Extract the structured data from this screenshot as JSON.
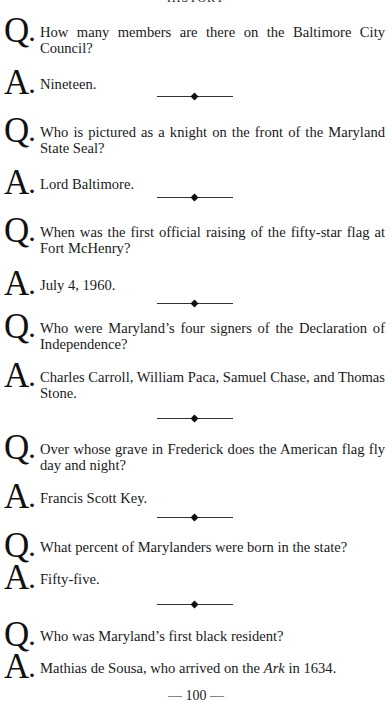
{
  "running_head": "HISTORY",
  "markers": {
    "question": "Q",
    "answer": "A",
    "dot": "."
  },
  "items": [
    {
      "question": "How many members are there on the Baltimore City Council?",
      "answer": "Nineteen."
    },
    {
      "question": "Who is pictured as a knight on the front of the Maryland State Seal?",
      "answer": "Lord Baltimore."
    },
    {
      "question": "When was the first official raising of the fifty-star flag at Fort McHenry?",
      "answer": "July 4, 1960."
    },
    {
      "question": "Who were Maryland’s four signers of the Declaration of Independence?",
      "answer": "Charles Carroll, William Paca, Samuel Chase, and Thomas Stone."
    },
    {
      "question": "Over whose grave in Frederick does the American flag fly day and night?",
      "answer": "Francis Scott Key."
    },
    {
      "question": "What percent of Marylanders were born in the state?",
      "answer": "Fifty-five."
    },
    {
      "question": "Who was Maryland’s first black resident?",
      "answer_parts": {
        "before": "Mathias de Sousa, who arrived on the ",
        "italic": "Ark",
        "after": " in 1634."
      }
    }
  ],
  "divider_icon": "diamond-rule",
  "page_number": "— 100 —"
}
